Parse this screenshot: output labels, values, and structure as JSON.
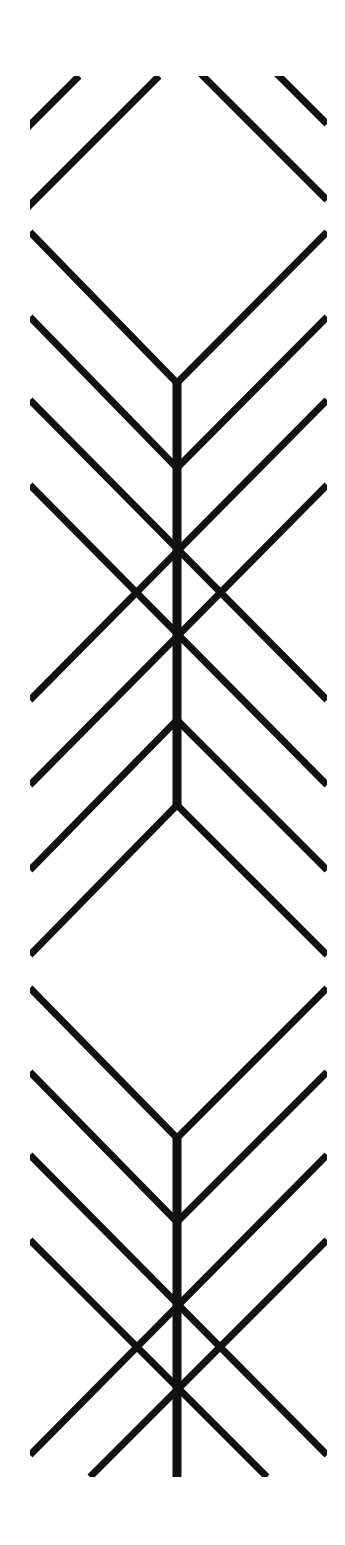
{
  "artwork": {
    "description": "Vertical black-on-white geometric line pattern of stacked chevrons and crossed diagonals along a central stem",
    "colors": {
      "background": "#ffffff",
      "stroke": "#111111"
    },
    "stroke_width": 7,
    "stem_width": 9,
    "top_fragments": [
      [
        30,
        125,
        79,
        76
      ],
      [
        30,
        205,
        159,
        76
      ],
      [
        203,
        76,
        327,
        200
      ],
      [
        279,
        76,
        327,
        124
      ]
    ],
    "chevrons": [
      {
        "name": "v1",
        "points": [
          [
            30,
            232
          ],
          [
            177,
            383
          ],
          [
            327,
            232
          ]
        ]
      },
      {
        "name": "v2",
        "points": [
          [
            30,
            317
          ],
          [
            177,
            468
          ],
          [
            327,
            317
          ]
        ]
      },
      {
        "name": "caret1",
        "points": [
          [
            30,
            870
          ],
          [
            177,
            720
          ],
          [
            327,
            870
          ]
        ]
      },
      {
        "name": "caret2",
        "points": [
          [
            30,
            955
          ],
          [
            177,
            805
          ],
          [
            327,
            955
          ]
        ]
      },
      {
        "name": "v3",
        "points": [
          [
            30,
            988
          ],
          [
            177,
            1138
          ],
          [
            327,
            988
          ]
        ]
      },
      {
        "name": "v4",
        "points": [
          [
            30,
            1072
          ],
          [
            177,
            1222
          ],
          [
            327,
            1072
          ]
        ]
      }
    ],
    "crosses": [
      [
        30,
        400,
        327,
        700
      ],
      [
        327,
        400,
        30,
        700
      ],
      [
        30,
        485,
        327,
        785
      ],
      [
        327,
        485,
        30,
        785
      ],
      [
        30,
        1155,
        327,
        1455
      ],
      [
        327,
        1155,
        30,
        1455
      ],
      [
        30,
        1240,
        267,
        1477
      ],
      [
        327,
        1240,
        90,
        1477
      ]
    ],
    "stems": [
      [
        177,
        383,
        177,
        805
      ],
      [
        177,
        1138,
        177,
        1477
      ]
    ]
  }
}
